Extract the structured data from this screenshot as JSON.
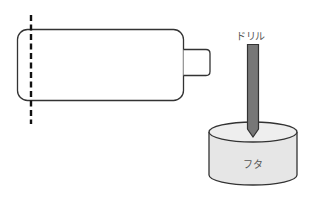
{
  "diagram": {
    "labels": {
      "drill": "ドリル",
      "lid": "フタ"
    },
    "colors": {
      "outline": "#333333",
      "drill_fill": "#777777",
      "lid_fill": "#e6e6e6",
      "lid_top_fill": "#f0f0f0",
      "dashed_line": "#111111",
      "label_text": "#555555"
    },
    "shapes": {
      "bottle": "rounded rectangle body with small cap on the right",
      "cut_line": "vertical dashed line near left end of bottle",
      "drill": "vertical gray bar with pointed tip",
      "lid": "short cylinder"
    }
  }
}
